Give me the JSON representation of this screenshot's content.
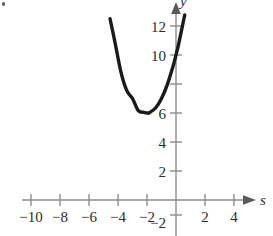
{
  "figure": {
    "name": "parabola-graph",
    "background_color": "#ffffff",
    "axis_color": "#8d8d8d",
    "curve_color": "#1a1a1a",
    "label_color": "#2b2b2b",
    "corner_mark": "bullet-speck"
  },
  "chart_data": {
    "type": "line",
    "title": "",
    "xlabel": "s",
    "ylabel": "y",
    "xlim": [
      -11.7,
      6.4
    ],
    "ylim": [
      -2.8,
      13.8
    ],
    "grid": false,
    "legend": null,
    "x_ticks": [
      -10,
      -8,
      -6,
      -4,
      -2,
      2,
      4
    ],
    "x_tick_labels": [
      "−10",
      "−8",
      "−6",
      "−4",
      "−2",
      "2",
      "4"
    ],
    "y_ticks": [
      -2,
      2,
      4,
      6,
      8,
      10,
      12
    ],
    "y_tick_labels": [
      "−2",
      "2",
      "4",
      "6",
      "8",
      "10",
      "12"
    ],
    "y_tick_labels_shown": [
      "−2",
      "2",
      "4",
      "6",
      "8",
      "10",
      "12"
    ],
    "y_unlabeled_ticks": [
      8
    ],
    "axis_arrows": [
      "x-positive",
      "y-positive"
    ],
    "series": [
      {
        "name": "parabola",
        "equation": "y = s^2 + 4s + 10",
        "vertex": [
          -2,
          6
        ],
        "x_domain": [
          -4.55,
          0.6
        ],
        "x": [
          -4.55,
          -4.2,
          -3.8,
          -3.4,
          -3.0,
          -2.6,
          -2.2,
          -2.0,
          -1.8,
          -1.4,
          -1.0,
          -0.6,
          -0.2,
          0.0,
          0.2,
          0.6
        ],
        "values": [
          12.5,
          10.84,
          8.84,
          7.56,
          7.0,
          6.16,
          6.04,
          6.0,
          6.04,
          6.36,
          7.0,
          7.96,
          9.24,
          10.0,
          10.84,
          12.76
        ]
      }
    ]
  },
  "axis_labels": {
    "x_axis_name": "s",
    "y_axis_name": "y"
  }
}
